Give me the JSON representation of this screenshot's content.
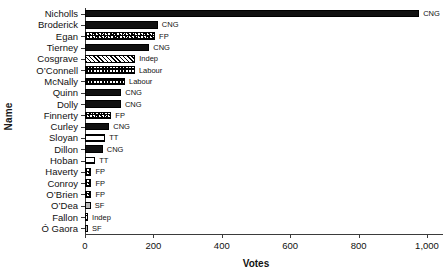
{
  "chart_data": {
    "type": "bar",
    "orientation": "horizontal",
    "title": "",
    "xlabel": "Votes",
    "ylabel": "Name",
    "xlim": [
      0,
      1040
    ],
    "xticks": [
      0,
      200,
      400,
      600,
      800,
      1000
    ],
    "xtick_labels": [
      "0",
      "200",
      "400",
      "600",
      "800",
      "1,000"
    ],
    "grid": false,
    "legend": "none",
    "categories": [
      "Nicholls",
      "Broderick",
      "Egan",
      "Tierney",
      "Cosgrave",
      "O’Connell",
      "McNally",
      "Quinn",
      "Dolly",
      "Finnerty",
      "Curley",
      "Sloyan",
      "Dillon",
      "Hoban",
      "Haverty",
      "Conroy",
      "O’Brien",
      "O’Dea",
      "Fallon",
      "Ó Gaora"
    ],
    "values": [
      977,
      213,
      205,
      188,
      147,
      146,
      117,
      106,
      105,
      77,
      71,
      59,
      52,
      30,
      19,
      19,
      19,
      17,
      9,
      6
    ],
    "point_labels": [
      "CNG",
      "CNG",
      "FP",
      "CNG",
      "Indep",
      "Labour",
      "Labour",
      "CNG",
      "CNG",
      "FP",
      "CNG",
      "TT",
      "CNG",
      "TT",
      "FP",
      "FP",
      "FP",
      "SF",
      "Indep",
      "SF"
    ],
    "bars": [
      {
        "name": "Nicholls",
        "votes": 977,
        "party": "CNG"
      },
      {
        "name": "Broderick",
        "votes": 213,
        "party": "CNG"
      },
      {
        "name": "Egan",
        "votes": 205,
        "party": "FP"
      },
      {
        "name": "Tierney",
        "votes": 188,
        "party": "CNG"
      },
      {
        "name": "Cosgrave",
        "votes": 147,
        "party": "Indep"
      },
      {
        "name": "O’Connell",
        "votes": 146,
        "party": "Labour"
      },
      {
        "name": "McNally",
        "votes": 117,
        "party": "Labour"
      },
      {
        "name": "Quinn",
        "votes": 106,
        "party": "CNG"
      },
      {
        "name": "Dolly",
        "votes": 105,
        "party": "CNG"
      },
      {
        "name": "Finnerty",
        "votes": 77,
        "party": "FP"
      },
      {
        "name": "Curley",
        "votes": 71,
        "party": "CNG"
      },
      {
        "name": "Sloyan",
        "votes": 59,
        "party": "TT"
      },
      {
        "name": "Dillon",
        "votes": 52,
        "party": "CNG"
      },
      {
        "name": "Hoban",
        "votes": 30,
        "party": "TT"
      },
      {
        "name": "Haverty",
        "votes": 19,
        "party": "FP"
      },
      {
        "name": "Conroy",
        "votes": 19,
        "party": "FP"
      },
      {
        "name": "O’Brien",
        "votes": 19,
        "party": "FP"
      },
      {
        "name": "O’Dea",
        "votes": 17,
        "party": "SF"
      },
      {
        "name": "Fallon",
        "votes": 9,
        "party": "Indep"
      },
      {
        "name": "Ó Gaora",
        "votes": 6,
        "party": "SF"
      }
    ],
    "parties": [
      "CNG",
      "FP",
      "Indep",
      "Labour",
      "TT",
      "SF"
    ],
    "colors": {
      "axis": "#3b3b3b",
      "text": "#111111",
      "CNG": "#111111",
      "SF": "#b9b9b9",
      "background": "#ffffff"
    }
  }
}
